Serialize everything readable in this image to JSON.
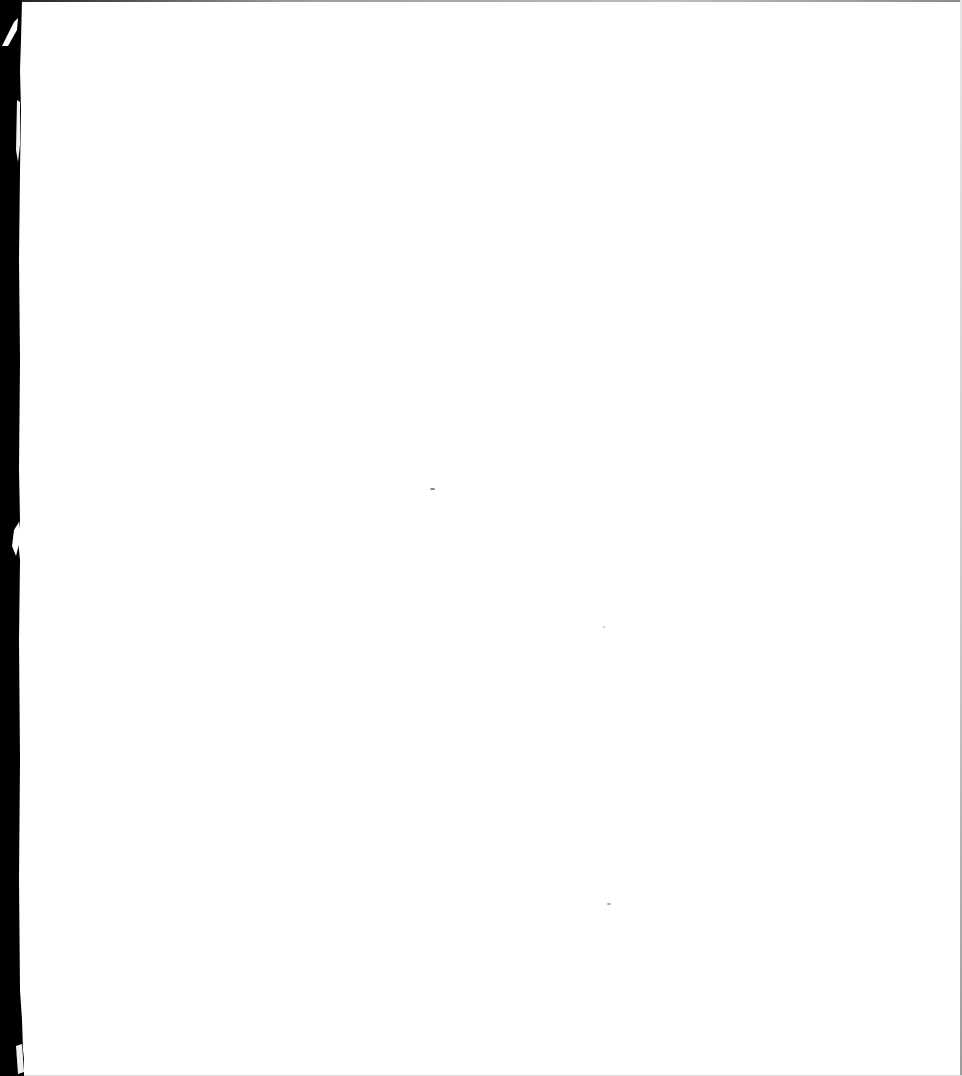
{
  "document": {
    "type": "scanned-page",
    "text": "",
    "colors": {
      "paper": "#ffffff",
      "binding": "#000000",
      "edge": "#9a9a9a"
    },
    "specks": [
      {
        "x": 430,
        "y": 488,
        "w": 5,
        "h": 2
      },
      {
        "x": 603,
        "y": 626,
        "w": 2,
        "h": 2
      },
      {
        "x": 607,
        "y": 903,
        "w": 4,
        "h": 2
      }
    ]
  }
}
